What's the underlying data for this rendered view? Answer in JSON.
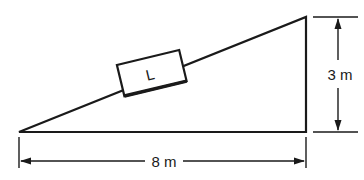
{
  "diagram": {
    "type": "inclined-plane",
    "block_label": "L",
    "height_label": "3 m",
    "base_label": "8 m",
    "stroke_color": "#1a1a1a"
  }
}
